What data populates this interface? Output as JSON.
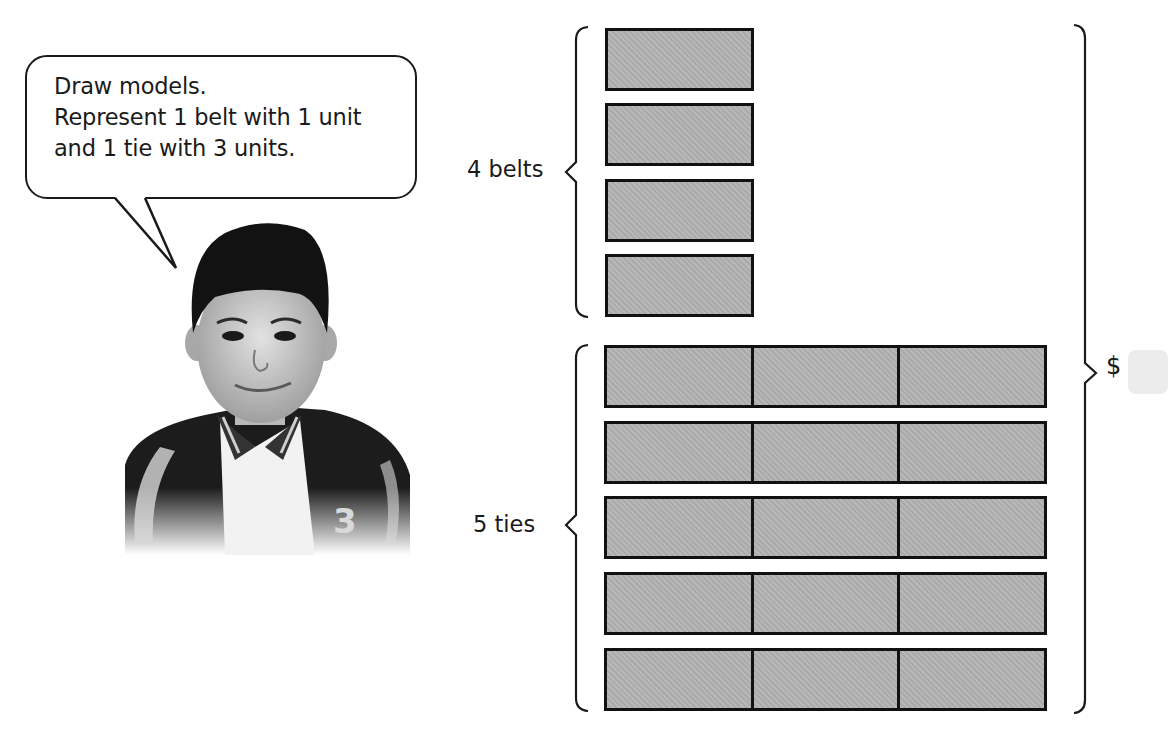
{
  "speech_bubble": {
    "lines": [
      "Draw models.",
      "Represent 1 belt with 1 unit",
      "and 1 tie with 3 units."
    ]
  },
  "character": {
    "description": "smiling boy in black-and-white varsity jacket"
  },
  "model": {
    "belts": {
      "label": "4 belts",
      "count": 4,
      "units_each": 1
    },
    "ties": {
      "label": "5 ties",
      "count": 5,
      "units_each": 3
    },
    "total": {
      "symbol": "$",
      "answer_value": ""
    },
    "colors": {
      "unit_fill": "#b3b3b3",
      "outline": "#111111",
      "answer_box": "#ececec"
    }
  }
}
